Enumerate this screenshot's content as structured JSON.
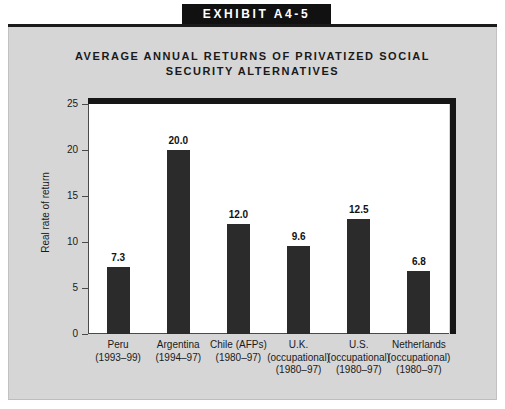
{
  "exhibit": {
    "banner_label": "EXHIBIT A4-5"
  },
  "chart_data": {
    "type": "bar",
    "title": "AVERAGE ANNUAL RETURNS OF PRIVATIZED SOCIAL SECURITY ALTERNATIVES",
    "title_line1": "AVERAGE ANNUAL RETURNS OF PRIVATIZED SOCIAL",
    "title_line2": "SECURITY ALTERNATIVES",
    "xlabel": "",
    "ylabel": "Real rate of return",
    "ylim": [
      0,
      25
    ],
    "ytick_values": [
      25,
      20,
      15,
      10,
      5,
      0
    ],
    "ytick_labels": [
      "25",
      "20",
      "15",
      "10",
      "5",
      "0"
    ],
    "grid": false,
    "legend": null,
    "bar_color": "#2b2b2b",
    "plot_background": "#ffffff",
    "categories": [
      "Peru (1993-99)",
      "Argentina (1994-97)",
      "Chile (AFPs) (1980-97)",
      "U.K. (occupational) (1980-97)",
      "U.S. (occupational) (1980-97)",
      "Netherlands (occupational) (1980-97)"
    ],
    "category_lines": [
      [
        "Peru",
        "(1993–99)"
      ],
      [
        "Argentina",
        "(1994–97)"
      ],
      [
        "Chile (AFPs)",
        "(1980–97)"
      ],
      [
        "U.K.",
        "(occupational)",
        "(1980–97)"
      ],
      [
        "U.S.",
        "(occupational)",
        "(1980–97)"
      ],
      [
        "Netherlands",
        "(occupational)",
        "(1980–97)"
      ]
    ],
    "values": [
      7.3,
      20.0,
      12.0,
      9.6,
      12.5,
      6.8
    ],
    "value_labels": [
      "7.3",
      "20.0",
      "12.0",
      "9.6",
      "12.5",
      "6.8"
    ]
  }
}
